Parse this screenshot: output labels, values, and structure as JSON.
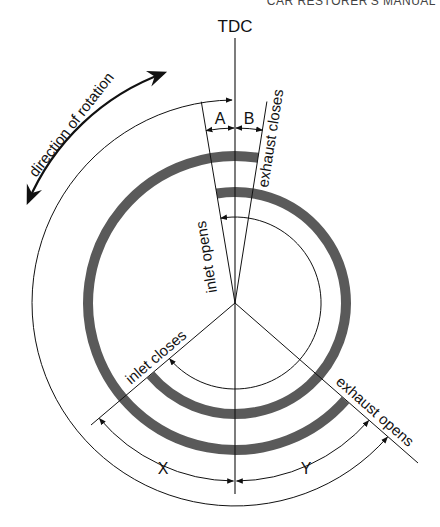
{
  "header": {
    "text": "CAR RESTORER'S MANUAL"
  },
  "diagram": {
    "reference_label": "TDC",
    "rotation_label": "direction of rotation",
    "events": {
      "inlet_opens": "inlet opens",
      "exhaust_closes": "exhaust closes",
      "inlet_closes": "inlet closes",
      "exhaust_opens": "exhaust opens"
    },
    "dimensions": {
      "a": "A",
      "b": "B",
      "x": "X",
      "y": "Y"
    },
    "colors": {
      "ring": "#5a5a5a",
      "line": "#111111",
      "background": "#ffffff"
    },
    "geometry": {
      "center": [
        235,
        303
      ],
      "angles_deg_from_tdc_clockwise": {
        "inlet_opens": -9.5,
        "exhaust_closes": 9,
        "exhaust_opens": 131.3,
        "inlet_closes": 229.5
      },
      "radii": {
        "inlet_period_arc": 86,
        "inlet_ring": 111,
        "exhaust_ring": 147,
        "xy_dimension_arc": 178,
        "ab_dimension_arc": 175,
        "outer_arc": 203
      }
    }
  }
}
